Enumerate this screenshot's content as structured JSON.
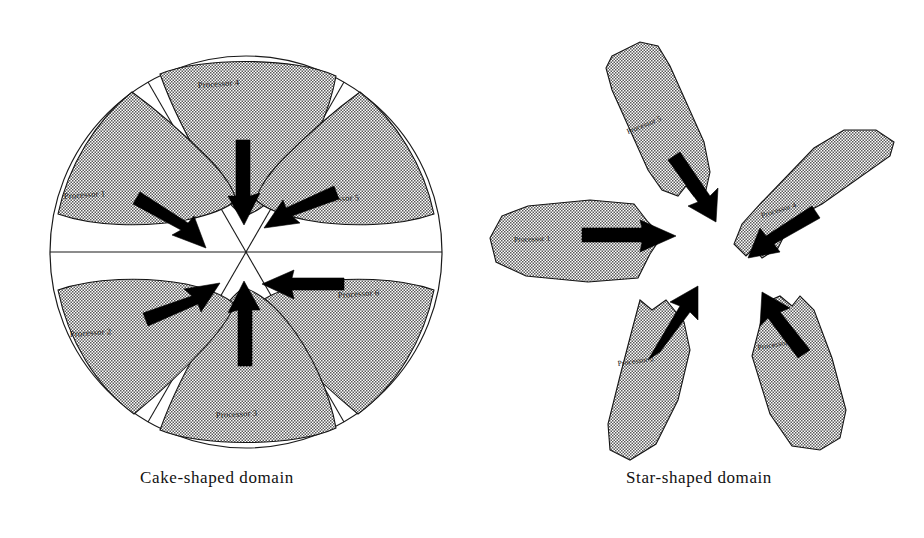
{
  "figure": {
    "background_color": "#ffffff",
    "ink_color": "#111111",
    "hatch_color": "#808080"
  },
  "panels": [
    {
      "id": "cake",
      "caption": "Cake-shaped domain",
      "shape": "circle divided into 6 sectors",
      "sector_count": 6,
      "labels": [
        {
          "text": "Processor 4",
          "position": "top"
        },
        {
          "text": "Processor 5",
          "position": "upper-right"
        },
        {
          "text": "Processor 6",
          "position": "lower-right"
        },
        {
          "text": "Processor 3",
          "position": "bottom"
        },
        {
          "text": "Processor 2",
          "position": "lower-left"
        },
        {
          "text": "Processor 1",
          "position": "upper-left"
        }
      ],
      "arrows": [
        {
          "from": "Processor 4",
          "direction": "down-toward-center"
        },
        {
          "from": "Processor 5",
          "direction": "down-left-toward-center"
        },
        {
          "from": "Processor 6",
          "direction": "left-toward-center"
        },
        {
          "from": "Processor 3",
          "direction": "up-toward-center"
        },
        {
          "from": "Processor 2",
          "direction": "up-right-toward-center"
        },
        {
          "from": "Processor 1",
          "direction": "down-right-toward-center"
        }
      ]
    },
    {
      "id": "star",
      "caption": "Star-shaped domain",
      "shape": "five-pointed star with lobed arms",
      "sector_count": 5,
      "labels": [
        {
          "text": "Processor 5",
          "position": "top"
        },
        {
          "text": "Processor 4",
          "position": "upper-right"
        },
        {
          "text": "Processor 3",
          "position": "lower-right"
        },
        {
          "text": "Processor 2",
          "position": "lower-left"
        },
        {
          "text": "Processor 1",
          "position": "left"
        }
      ],
      "arrows": [
        {
          "from": "Processor 5",
          "direction": "down-right-toward-center"
        },
        {
          "from": "Processor 4",
          "direction": "down-left-toward-center"
        },
        {
          "from": "Processor 3",
          "direction": "up-left-toward-center"
        },
        {
          "from": "Processor 2",
          "direction": "up-right-toward-center"
        },
        {
          "from": "Processor 1",
          "direction": "right-toward-center"
        }
      ]
    }
  ]
}
